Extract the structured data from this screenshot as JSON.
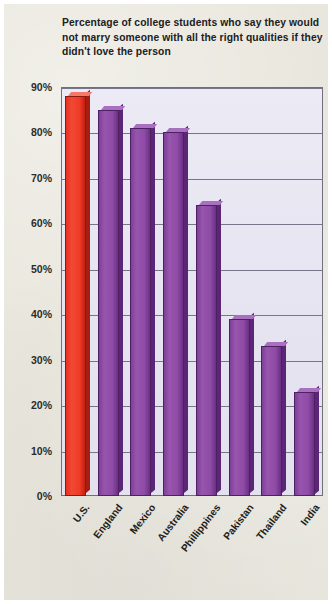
{
  "title": "Percentage of college students who say they would not marry someone with all the right qualities if they didn't love the person",
  "colors": {
    "page_background": "#E9E7DD",
    "plot_background": "#E8E6F2",
    "gridline": "#76768A",
    "highlight_bar": "#ED3124",
    "bar": "#8E4CA8",
    "bar_shadow": "#5A2476",
    "text": "#20201E"
  },
  "chart_data": {
    "type": "bar",
    "title": "Percentage of college students who say they would not marry someone with all the right qualities if they didn't love the person",
    "xlabel": "",
    "ylabel": "",
    "ylim": [
      0,
      90
    ],
    "grid": true,
    "legend": "none",
    "orientation": "vertical",
    "categories": [
      "U.S.",
      "England",
      "Mexico",
      "Australia",
      "Phillippines",
      "Pakistan",
      "Thailand",
      "India"
    ],
    "values": [
      88,
      85,
      81,
      80,
      64,
      39,
      33,
      23
    ],
    "value_suffix": "%",
    "highlight_index": 0,
    "ytick_labels": [
      "90%",
      "80%",
      "70%",
      "60%",
      "50%",
      "40%",
      "30%",
      "20%",
      "10%",
      "0%"
    ],
    "ytick_values": [
      90,
      80,
      70,
      60,
      50,
      40,
      30,
      20,
      10,
      0
    ],
    "bar_colors": [
      "#ED3124",
      "#8E4CA8",
      "#8E4CA8",
      "#8E4CA8",
      "#8E4CA8",
      "#8E4CA8",
      "#8E4CA8",
      "#8E4CA8"
    ]
  }
}
